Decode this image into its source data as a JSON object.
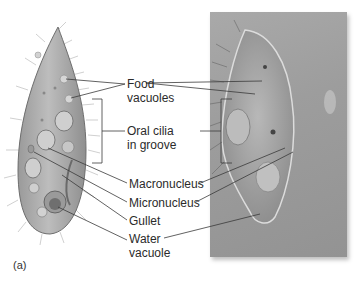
{
  "figure": {
    "panel_label": "(a)",
    "labels": {
      "food_vacuoles": [
        "Food",
        "vacuoles"
      ],
      "oral_cilia": [
        "Oral cilia",
        "in groove"
      ],
      "macronucleus": "Macronucleus",
      "micronucleus": "Micronucleus",
      "gullet": "Gullet",
      "water_vacuole": [
        "Water",
        "vacuole"
      ]
    },
    "colors": {
      "drawing_body": "#a8a8a8",
      "drawing_outline": "#6e6e6e",
      "photo_bg": "#9d9d9d",
      "leader_line": "#3a3a3a",
      "text": "#2b2b2b"
    }
  }
}
